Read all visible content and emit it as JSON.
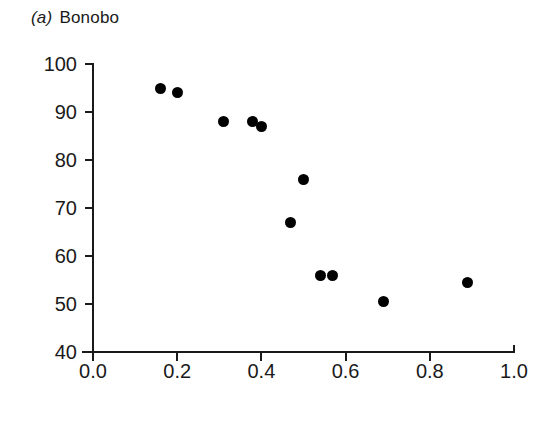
{
  "figure": {
    "panel_tag": "(a)",
    "panel_label": "Bonobo",
    "marker_color": "#000000",
    "axis_color": "#1a1a1a",
    "background": "#ffffff"
  },
  "chart_data": {
    "type": "scatter",
    "subtitle": "",
    "xlabel": "",
    "ylabel": "",
    "xlim": [
      0.0,
      1.0
    ],
    "ylim": [
      40,
      100
    ],
    "xticks": [
      0.0,
      0.2,
      0.4,
      0.6,
      0.8,
      1.0
    ],
    "yticks": [
      40,
      50,
      60,
      70,
      80,
      90,
      100
    ],
    "xticklabels": [
      "0.0",
      "0.2",
      "0.4",
      "0.6",
      "0.8",
      "1.0"
    ],
    "yticklabels": [
      "40",
      "50",
      "60",
      "70",
      "80",
      "90",
      "100"
    ],
    "grid": false,
    "legend": null,
    "marker": "filled-circle",
    "points": [
      {
        "x": 0.16,
        "y": 95.0
      },
      {
        "x": 0.2,
        "y": 94.0
      },
      {
        "x": 0.31,
        "y": 88.0
      },
      {
        "x": 0.38,
        "y": 88.0
      },
      {
        "x": 0.4,
        "y": 87.0
      },
      {
        "x": 0.47,
        "y": 67.0
      },
      {
        "x": 0.5,
        "y": 76.0
      },
      {
        "x": 0.54,
        "y": 56.0
      },
      {
        "x": 0.57,
        "y": 56.0
      },
      {
        "x": 0.69,
        "y": 50.5
      },
      {
        "x": 0.89,
        "y": 54.5
      }
    ],
    "n_points": 11
  }
}
